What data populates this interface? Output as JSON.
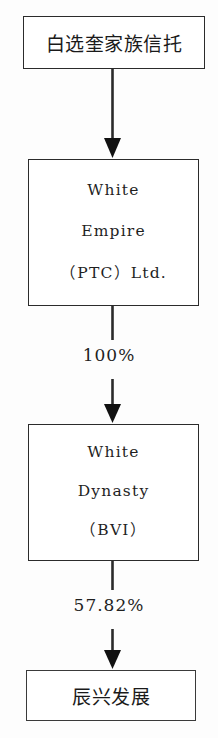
{
  "diagram": {
    "type": "ownership-structure-flowchart",
    "orientation": "top-to-bottom",
    "background_color": "#fdfdfd",
    "line_color": "#2b2b2b",
    "text_color": "#1a1a1a"
  },
  "nodes": [
    {
      "id": "trust",
      "label": "白选奎家族信托",
      "lines": [
        "白选奎家族信托"
      ],
      "script": "chinese"
    },
    {
      "id": "white-empire",
      "label": "White Empire (PTC)Ltd.",
      "lines": [
        "White",
        "Empire",
        "（PTC）Ltd."
      ],
      "script": "latin"
    },
    {
      "id": "white-dynasty",
      "label": "White Dynasty (BVI)",
      "lines": [
        "White",
        "Dynasty",
        "（BVI）"
      ],
      "script": "latin"
    },
    {
      "id": "chenxing",
      "label": "辰兴发展",
      "lines": [
        "辰兴发展"
      ],
      "script": "chinese"
    }
  ],
  "edges": [
    {
      "id": "trust-to-white-empire",
      "from": "trust",
      "to": "white-empire",
      "label": "",
      "arrow": "down"
    },
    {
      "id": "white-empire-to-white-dynasty",
      "from": "white-empire",
      "to": "white-dynasty",
      "label": "100%",
      "arrow": "down"
    },
    {
      "id": "white-dynasty-to-chenxing",
      "from": "white-dynasty",
      "to": "chenxing",
      "label": "57.82%",
      "arrow": "down"
    }
  ]
}
